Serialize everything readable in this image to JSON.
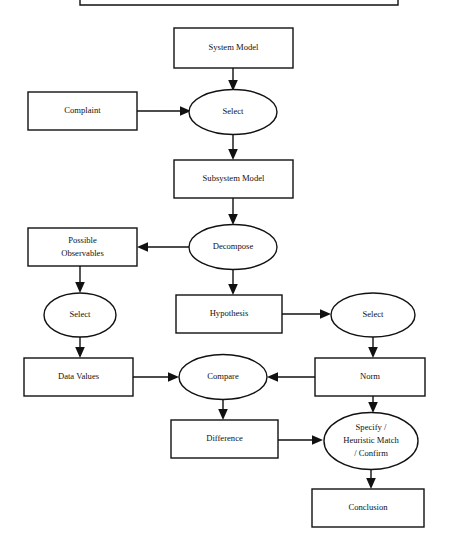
{
  "diagram": {
    "background_color": "#ffffff",
    "line_color": "#111111",
    "shape_fill": "#ffffff",
    "nodes": {
      "system_model": {
        "label": "System Model",
        "shape": "rectangle"
      },
      "complaint": {
        "label": "Complaint",
        "shape": "rectangle"
      },
      "select_1": {
        "label": "Select",
        "shape": "ellipse"
      },
      "subsystem_model": {
        "label": "Subsystem Model",
        "shape": "rectangle"
      },
      "decompose": {
        "label": "Decompose",
        "shape": "ellipse"
      },
      "possible_observables": {
        "shape": "rectangle",
        "line1": "Possible",
        "line2": "Observables"
      },
      "select_2": {
        "label": "Select",
        "shape": "ellipse"
      },
      "hypothesis": {
        "label": "Hypothesis",
        "shape": "rectangle"
      },
      "select_3": {
        "label": "Select",
        "shape": "ellipse"
      },
      "data_values": {
        "label": "Data Values",
        "shape": "rectangle"
      },
      "compare": {
        "label": "Compare",
        "shape": "ellipse"
      },
      "norm": {
        "label": "Norm",
        "shape": "rectangle"
      },
      "difference": {
        "label": "Difference",
        "shape": "rectangle"
      },
      "specify_heuristic": {
        "shape": "ellipse",
        "line1": "Specify /",
        "line2": "Heuristic Match",
        "line3": "/ Confirm"
      },
      "conclusion": {
        "label": "Conclusion",
        "shape": "rectangle"
      }
    },
    "edges": [
      {
        "name": "system-model-to-select-1",
        "from": "system_model",
        "to": "select_1",
        "direction": "down"
      },
      {
        "name": "complaint-to-select-1",
        "from": "complaint",
        "to": "select_1",
        "direction": "right"
      },
      {
        "name": "select-1-to-subsystem-model",
        "from": "select_1",
        "to": "subsystem_model",
        "direction": "down"
      },
      {
        "name": "subsystem-model-to-decompose",
        "from": "subsystem_model",
        "to": "decompose",
        "direction": "down"
      },
      {
        "name": "decompose-to-possible-observables",
        "from": "decompose",
        "to": "possible_observables",
        "direction": "left"
      },
      {
        "name": "decompose-to-hypothesis",
        "from": "decompose",
        "to": "hypothesis",
        "direction": "down"
      },
      {
        "name": "possible-observables-to-select-2",
        "from": "possible_observables",
        "to": "select_2",
        "direction": "down"
      },
      {
        "name": "select-2-to-data-values",
        "from": "select_2",
        "to": "data_values",
        "direction": "down"
      },
      {
        "name": "hypothesis-to-select-3",
        "from": "hypothesis",
        "to": "select_3",
        "direction": "right"
      },
      {
        "name": "select-3-to-norm",
        "from": "select_3",
        "to": "norm",
        "direction": "down"
      },
      {
        "name": "data-values-to-compare",
        "from": "data_values",
        "to": "compare",
        "direction": "right"
      },
      {
        "name": "norm-to-compare",
        "from": "norm",
        "to": "compare",
        "direction": "left"
      },
      {
        "name": "compare-to-difference",
        "from": "compare",
        "to": "difference",
        "direction": "down"
      },
      {
        "name": "difference-to-specify",
        "from": "difference",
        "to": "specify_heuristic",
        "direction": "right"
      },
      {
        "name": "norm-to-specify",
        "from": "norm",
        "to": "specify_heuristic",
        "direction": "down"
      },
      {
        "name": "specify-to-conclusion",
        "from": "specify_heuristic",
        "to": "conclusion",
        "direction": "down"
      }
    ]
  }
}
